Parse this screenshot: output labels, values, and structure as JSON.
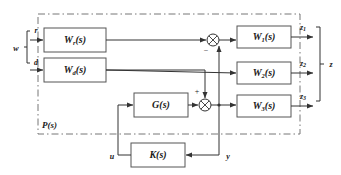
{
  "diagram": {
    "type": "control-block-diagram",
    "background_color": "#ffffff",
    "line_color": "#333333",
    "box_fill": "#ffffff",
    "box_stroke": "#555555",
    "plant_boundary_stroke": "#777777"
  },
  "blocks": [
    {
      "id": "Wr",
      "label": "W",
      "subscript": "r",
      "suffix": "(s)",
      "x": 44,
      "y": 28,
      "w": 62,
      "h": 24
    },
    {
      "id": "Wd",
      "label": "W",
      "subscript": "d",
      "suffix": "(s)",
      "x": 44,
      "y": 58,
      "w": 62,
      "h": 24
    },
    {
      "id": "G",
      "label": "G",
      "subscript": "",
      "suffix": "(s)",
      "x": 134,
      "y": 93,
      "w": 54,
      "h": 24
    },
    {
      "id": "K",
      "label": "K",
      "subscript": "",
      "suffix": "(s)",
      "x": 131,
      "y": 143,
      "w": 54,
      "h": 24
    },
    {
      "id": "W1",
      "label": "W",
      "subscript": "1",
      "suffix": "(s)",
      "x": 237,
      "y": 26,
      "w": 54,
      "h": 22
    },
    {
      "id": "W2",
      "label": "W",
      "subscript": "2",
      "suffix": "(s)",
      "x": 237,
      "y": 62,
      "w": 54,
      "h": 22
    },
    {
      "id": "W3",
      "label": "W",
      "subscript": "3",
      "suffix": "(s)",
      "x": 237,
      "y": 95,
      "w": 54,
      "h": 22
    }
  ],
  "summing_junctions": [
    {
      "id": "sum-top",
      "cx": 213,
      "cy": 40,
      "r": 6,
      "sign": "−",
      "sign_x": 206,
      "sign_y": 52
    },
    {
      "id": "sum-bottom",
      "cx": 205,
      "cy": 105,
      "r": 6,
      "sign": "+",
      "sign_x": 198,
      "sign_y": 92
    }
  ],
  "signals": {
    "w": {
      "label": "w",
      "x": 16,
      "y": 56
    },
    "r": {
      "label": "r",
      "x": 35,
      "y": 31
    },
    "d": {
      "label": "d",
      "x": 35,
      "y": 63
    },
    "u": {
      "label": "u",
      "x": 113,
      "y": 157
    },
    "y": {
      "label": "y",
      "x": 228,
      "y": 157
    },
    "z": {
      "label": "z",
      "x": 328,
      "y": 71
    },
    "z1": {
      "label": "z",
      "subscript": "1",
      "x": 305,
      "y": 28
    },
    "z2": {
      "label": "z",
      "subscript": "2",
      "x": 305,
      "y": 65
    },
    "z3": {
      "label": "z",
      "subscript": "3",
      "x": 305,
      "y": 98
    }
  },
  "plant": {
    "label": "P",
    "suffix": "(s)",
    "label_x": 42,
    "label_y": 126,
    "x": 38,
    "y": 14,
    "w": 262,
    "h": 120
  },
  "braces": {
    "input_brace": {
      "name": "w-brace",
      "x": 27,
      "y_top": 31,
      "y_bottom": 63,
      "y_mid": 56
    },
    "output_brace": {
      "name": "z-brace",
      "x": 318,
      "y_top": 26,
      "y_bottom": 101,
      "y_mid": 71
    }
  },
  "signs": {
    "minus": "−",
    "plus": "+"
  }
}
